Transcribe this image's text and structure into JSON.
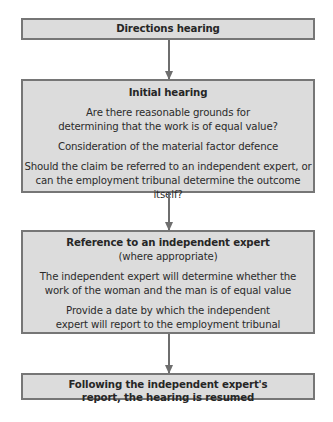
{
  "diagram": {
    "type": "flowchart",
    "direction": "top-to-bottom",
    "colors": {
      "box_fill": "#dcdcdc",
      "box_border": "#767676",
      "arrow": "#6e6e6e",
      "text": "#2b2b2b"
    },
    "nodes": [
      {
        "id": "directions",
        "title": "Directions hearing",
        "lines": []
      },
      {
        "id": "initial",
        "title": "Initial hearing",
        "paragraphs": [
          [
            "Are there reasonable grounds for",
            "determining that the work is of equal value?"
          ],
          [
            "Consideration of the material factor defence"
          ],
          [
            "Should the claim be referred to an independent expert, or",
            "can the employment tribunal determine the outcome itself?"
          ]
        ]
      },
      {
        "id": "reference",
        "title": "Reference to an independent expert",
        "subtitle": "(where appropriate)",
        "paragraphs": [
          [
            "The independent expert will determine whether the",
            "work of the woman and the man is of equal value"
          ],
          [
            "Provide a date by which the independent",
            "expert will report to the employment tribunal"
          ]
        ]
      },
      {
        "id": "following",
        "title_lines": [
          "Following the independent expert's",
          "report, the hearing is resumed"
        ]
      }
    ],
    "edges": [
      {
        "from": "directions",
        "to": "initial"
      },
      {
        "from": "initial",
        "to": "reference"
      },
      {
        "from": "reference",
        "to": "following"
      }
    ]
  }
}
